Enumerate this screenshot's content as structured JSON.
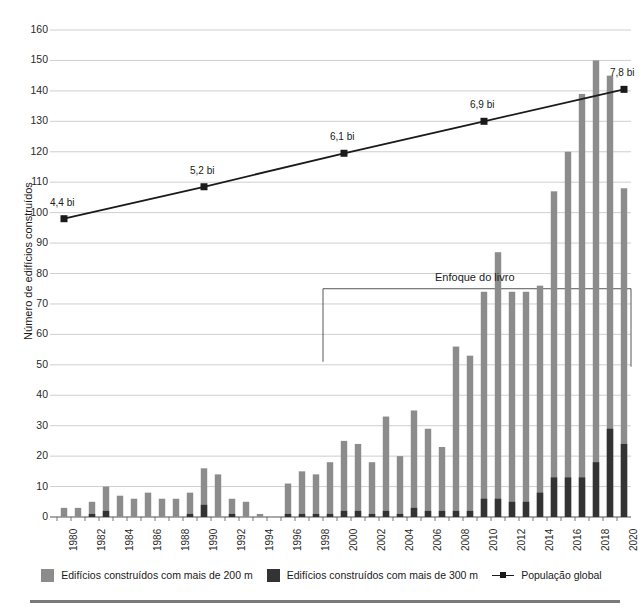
{
  "chart_data": {
    "type": "bar",
    "title": "",
    "xlabel": "",
    "ylabel": "Número de edifícios construídos",
    "ylim": [
      0,
      160
    ],
    "ytick_step": 10,
    "grid": true,
    "legend_position": "bottom",
    "x": [
      1980,
      1981,
      1982,
      1983,
      1984,
      1985,
      1986,
      1987,
      1988,
      1989,
      1990,
      1991,
      1992,
      1993,
      1994,
      1995,
      1996,
      1997,
      1998,
      1999,
      2000,
      2001,
      2002,
      2003,
      2004,
      2005,
      2006,
      2007,
      2008,
      2009,
      2010,
      2011,
      2012,
      2013,
      2014,
      2015,
      2016,
      2017,
      2018,
      2019,
      2020
    ],
    "xtick_labels": [
      "1980",
      "1982",
      "1984",
      "1986",
      "1988",
      "1990",
      "1992",
      "1994",
      "1996",
      "1998",
      "2000",
      "2002",
      "2004",
      "2006",
      "2008",
      "2010",
      "2012",
      "2014",
      "2016",
      "2018",
      "2020"
    ],
    "series": [
      {
        "name": "Edifícios construídos com mais de 200 m",
        "color": "#8c8c8c",
        "values": [
          3,
          3,
          5,
          10,
          7,
          6,
          8,
          6,
          6,
          8,
          16,
          14,
          6,
          5,
          1,
          0,
          11,
          15,
          14,
          18,
          25,
          24,
          18,
          33,
          20,
          35,
          29,
          23,
          56,
          53,
          74,
          87,
          74,
          74,
          76,
          107,
          120,
          139,
          150,
          145,
          108
        ]
      },
      {
        "name": "Edifícios construídos com mais de 300 m",
        "color": "#333333",
        "values": [
          0,
          0,
          1,
          2,
          0,
          0,
          0,
          0,
          0,
          1,
          4,
          0,
          1,
          0,
          0,
          0,
          1,
          1,
          1,
          1,
          2,
          2,
          1,
          2,
          1,
          3,
          2,
          2,
          2,
          2,
          6,
          6,
          5,
          5,
          8,
          13,
          13,
          13,
          18,
          29,
          24
        ]
      }
    ],
    "line_series": {
      "name": "População global",
      "color": "#1a1a1a",
      "marker": "square",
      "points": [
        {
          "x": 1980,
          "y": 98,
          "label": "4,4 bi"
        },
        {
          "x": 1990,
          "y": 108.5,
          "label": "5,2 bi"
        },
        {
          "x": 2000,
          "y": 119.5,
          "label": "6,1 bi"
        },
        {
          "x": 2010,
          "y": 130,
          "label": "6,9 bi"
        },
        {
          "x": 2020,
          "y": 140.5,
          "label": "7,8 bi"
        }
      ]
    },
    "annotations": [
      {
        "name": "focus-bracket",
        "label": "Enfoque do livro",
        "x_start": 1999,
        "x_end": 2020,
        "y_top": 75
      }
    ]
  },
  "legend": {
    "items": [
      {
        "label": "Edifícios construídos com mais de 200 m",
        "type": "swatch",
        "color": "#8c8c8c"
      },
      {
        "label": "Edifícios construídos com mais de 300 m",
        "type": "swatch",
        "color": "#333333"
      },
      {
        "label": "População global",
        "type": "line",
        "color": "#1a1a1a"
      }
    ]
  }
}
